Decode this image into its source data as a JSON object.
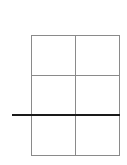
{
  "diagram": {
    "type": "grid-with-line",
    "grid": {
      "rows": 3,
      "columns": 2,
      "line_color": "#8a8a8a"
    },
    "overlay_line": {
      "orientation": "horizontal",
      "color": "#1a1a1a",
      "position": "at lower third boundary, extending past left edge"
    }
  }
}
